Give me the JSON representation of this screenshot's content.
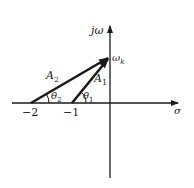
{
  "diagram": {
    "type": "s-plane vector diagram",
    "axes": {
      "vertical_label": "jω",
      "horizontal_label": "σ"
    },
    "points": {
      "neg2": "−2",
      "neg1": "−1",
      "omega_k_base": "ω",
      "omega_k_sub": "k"
    },
    "vectors": [
      {
        "name": "A",
        "sub": "2",
        "from": "−2",
        "to": "jω_k"
      },
      {
        "name": "A",
        "sub": "1",
        "from": "−1",
        "to": "jω_k"
      }
    ],
    "angles": [
      {
        "name": "θ",
        "sub": "2"
      },
      {
        "name": "θ",
        "sub": "1"
      }
    ],
    "colors": {
      "ink": "#1a1a1a",
      "background": "#ffffff"
    }
  }
}
